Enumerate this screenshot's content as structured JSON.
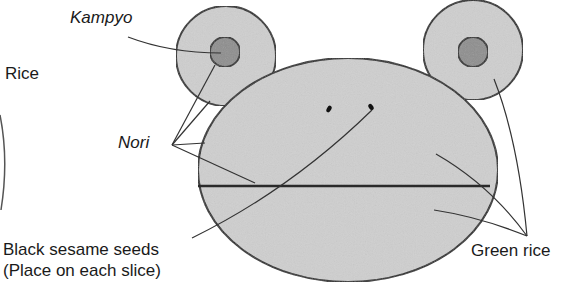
{
  "diagram": {
    "type": "sushi-roll-face-illustration",
    "labels": {
      "kampyo": "Kampyo",
      "rice": "Rice",
      "nori": "Nori",
      "sesame_line1": "Black sesame seeds",
      "sesame_line2": "(Place on each slice)",
      "green_rice": "Green rice"
    },
    "colors": {
      "outline": "#2a2a2a",
      "green_rice_fill": "#cfcfcf",
      "kampyo_fill": "#8e8e8e",
      "background": "#ffffff"
    },
    "parts": [
      "left-ear",
      "right-ear",
      "left-kampyo",
      "right-kampyo",
      "face",
      "nori-divider",
      "left-eye-seed",
      "right-eye-seed",
      "rice-arc"
    ]
  }
}
